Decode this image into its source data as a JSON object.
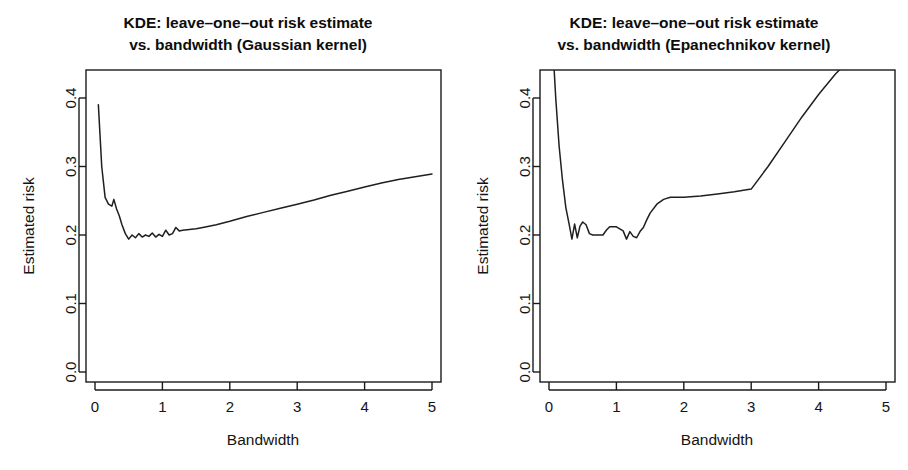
{
  "figure": {
    "background": "#ffffff",
    "line_color": "#1f1f1f",
    "axis_color": "#1a1a1a",
    "width": 908,
    "height": 470
  },
  "chart_data": [
    {
      "type": "line",
      "panel": "left",
      "title": "KDE: leave-one-out risk estimate\nvs. bandwidth (Gaussian kernel)",
      "title_line1": "KDE: leave–one–out risk estimate",
      "title_line2": "vs. bandwidth (Gaussian kernel)",
      "xlabel": "Bandwidth",
      "ylabel": "Estimated risk",
      "xlim": [
        0.0,
        5.0
      ],
      "ylim": [
        0.0,
        0.44
      ],
      "xticks": [
        0,
        1,
        2,
        3,
        4,
        5
      ],
      "xtick_labels": [
        "0",
        "1",
        "2",
        "3",
        "4",
        "5"
      ],
      "yticks": [
        0.0,
        0.1,
        0.2,
        0.3,
        0.4
      ],
      "ytick_labels": [
        "0.0",
        "0.1",
        "0.2",
        "0.3",
        "0.4"
      ],
      "grid": false,
      "legend": false,
      "series": [
        {
          "name": "Gaussian kernel LOO risk",
          "x": [
            0.05,
            0.1,
            0.15,
            0.2,
            0.25,
            0.28,
            0.32,
            0.36,
            0.4,
            0.45,
            0.5,
            0.55,
            0.6,
            0.65,
            0.7,
            0.75,
            0.8,
            0.85,
            0.9,
            0.95,
            1.0,
            1.05,
            1.1,
            1.15,
            1.2,
            1.25,
            1.3,
            1.4,
            1.5,
            1.6,
            1.8,
            2.0,
            2.25,
            2.5,
            2.75,
            3.0,
            3.25,
            3.5,
            3.75,
            4.0,
            4.25,
            4.5,
            4.75,
            5.0
          ],
          "y": [
            0.39,
            0.3,
            0.255,
            0.245,
            0.242,
            0.252,
            0.238,
            0.228,
            0.215,
            0.202,
            0.194,
            0.2,
            0.196,
            0.202,
            0.197,
            0.2,
            0.198,
            0.203,
            0.197,
            0.201,
            0.198,
            0.207,
            0.2,
            0.202,
            0.211,
            0.206,
            0.207,
            0.208,
            0.209,
            0.211,
            0.215,
            0.22,
            0.227,
            0.233,
            0.239,
            0.245,
            0.251,
            0.258,
            0.264,
            0.27,
            0.276,
            0.281,
            0.285,
            0.289
          ]
        }
      ]
    },
    {
      "type": "line",
      "panel": "right",
      "title": "KDE: leave-one-out risk estimate\nvs. bandwidth (Epanechnikov kernel)",
      "title_line1": "KDE: leave–one–out risk estimate",
      "title_line2": "vs. bandwidth (Epanechnikov kernel)",
      "xlabel": "Bandwidth",
      "ylabel": "Estimated risk",
      "xlim": [
        0.0,
        5.0
      ],
      "ylim": [
        0.0,
        0.44
      ],
      "xticks": [
        0,
        1,
        2,
        3,
        4,
        5
      ],
      "xtick_labels": [
        "0",
        "1",
        "2",
        "3",
        "4",
        "5"
      ],
      "yticks": [
        0.0,
        0.1,
        0.2,
        0.3,
        0.4
      ],
      "ytick_labels": [
        "0.0",
        "0.1",
        "0.2",
        "0.3",
        "0.4"
      ],
      "grid": false,
      "legend": false,
      "clipped_top": true,
      "series": [
        {
          "name": "Epanechnikov kernel LOO risk",
          "x": [
            0.06,
            0.1,
            0.15,
            0.2,
            0.25,
            0.3,
            0.34,
            0.38,
            0.42,
            0.46,
            0.5,
            0.55,
            0.6,
            0.65,
            0.7,
            0.75,
            0.8,
            0.85,
            0.9,
            1.0,
            1.1,
            1.15,
            1.2,
            1.25,
            1.3,
            1.35,
            1.4,
            1.45,
            1.5,
            1.6,
            1.7,
            1.8,
            1.9,
            2.0,
            2.25,
            2.5,
            2.75,
            3.0,
            3.25,
            3.5,
            3.75,
            4.0,
            4.25,
            4.4
          ],
          "y": [
            0.47,
            0.4,
            0.33,
            0.28,
            0.24,
            0.215,
            0.194,
            0.216,
            0.196,
            0.213,
            0.219,
            0.215,
            0.202,
            0.2,
            0.2,
            0.2,
            0.2,
            0.207,
            0.212,
            0.212,
            0.206,
            0.194,
            0.205,
            0.198,
            0.196,
            0.205,
            0.211,
            0.222,
            0.232,
            0.245,
            0.252,
            0.255,
            0.255,
            0.255,
            0.257,
            0.26,
            0.263,
            0.267,
            0.3,
            0.336,
            0.372,
            0.405,
            0.435,
            0.45
          ]
        }
      ]
    }
  ]
}
